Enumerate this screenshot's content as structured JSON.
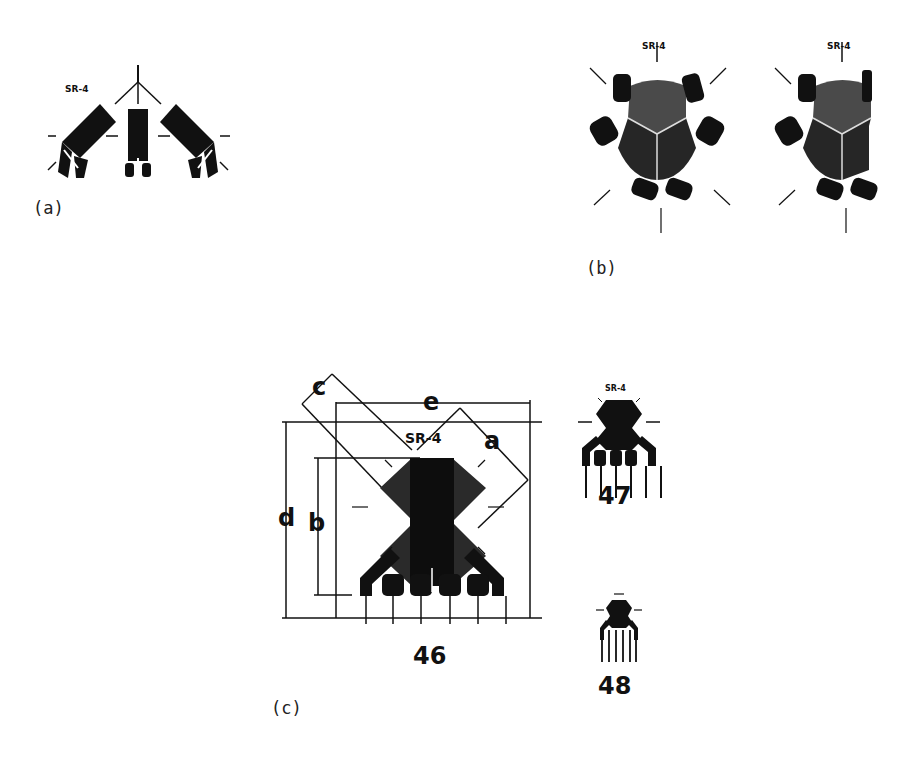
{
  "figure": {
    "panels": [
      {
        "id": "a",
        "label": "(a)",
        "gauge_marking": "SR-4",
        "description": "three-element planar rosette, fan layout"
      },
      {
        "id": "b",
        "label": "(b)",
        "gauge_markings": [
          "SR-4",
          "SR-4"
        ],
        "description": "two stacked delta rosettes, circular grid with three sectors"
      },
      {
        "id": "c",
        "label": "(c)",
        "description": "stacked rectangular rosettes with dimension callouts",
        "gauges": [
          {
            "number": "46",
            "marking": "SR-4",
            "dimensions": [
              "a",
              "b",
              "c",
              "d",
              "e"
            ]
          },
          {
            "number": "47",
            "marking": "SR-4"
          },
          {
            "number": "48",
            "marking": "SR-4"
          }
        ]
      }
    ]
  },
  "colors": {
    "ink": "#111111",
    "grid_fill": "#2a2a2a",
    "background": "#ffffff"
  }
}
